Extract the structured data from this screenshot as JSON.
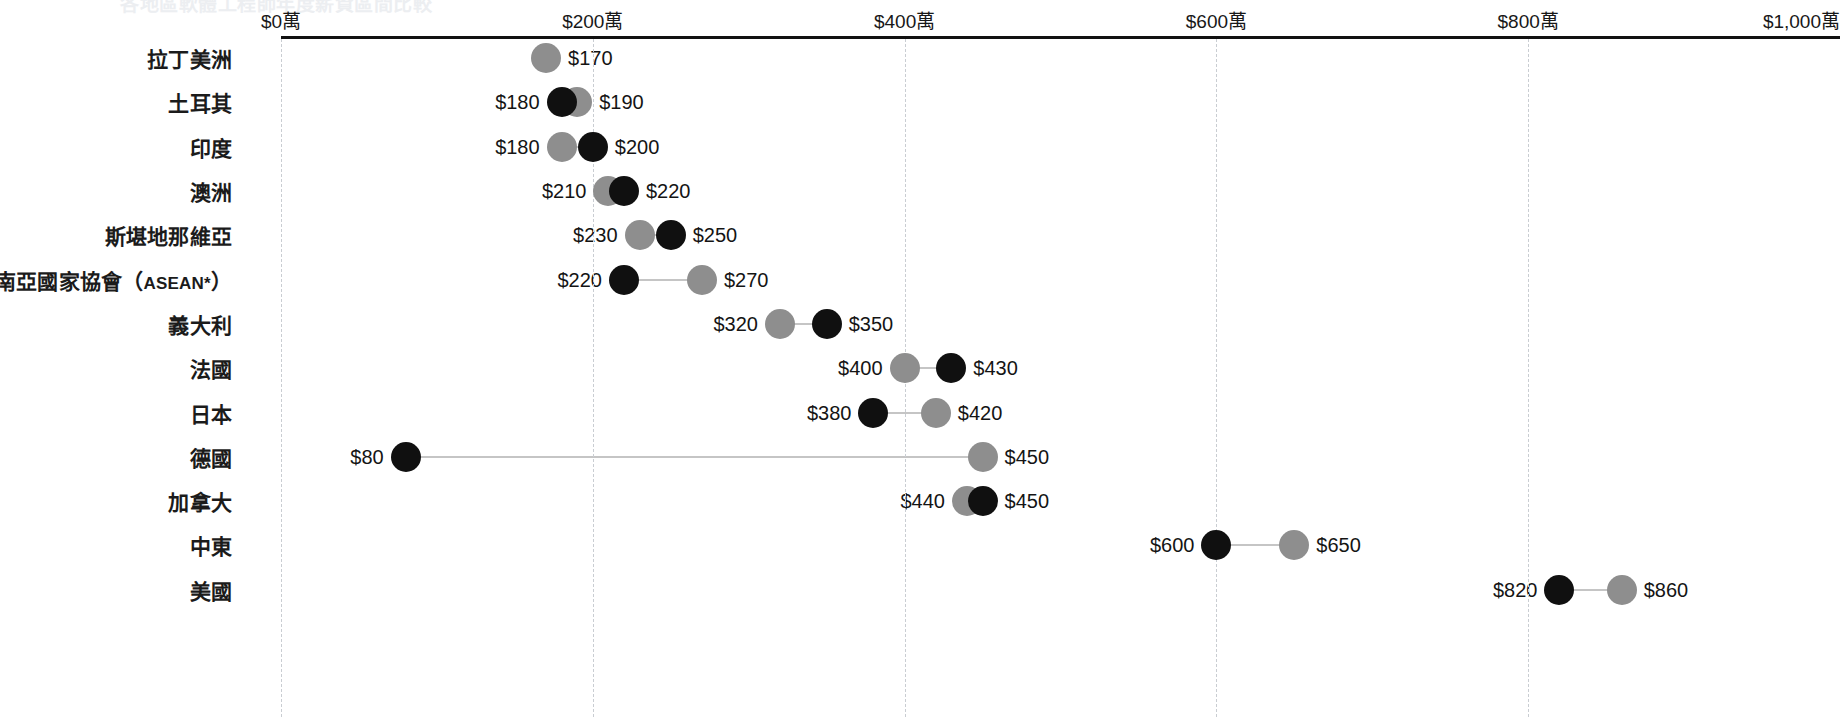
{
  "clipped_title": "各地區軟體工程師年度薪資區間比較",
  "axis": {
    "ticks": [
      {
        "label": "$0萬",
        "value": 0
      },
      {
        "label": "$200萬",
        "value": 200
      },
      {
        "label": "$400萬",
        "value": 400
      },
      {
        "label": "$600萬",
        "value": 600
      },
      {
        "label": "$800萬",
        "value": 800
      },
      {
        "label": "$1,000萬",
        "value": 1000
      }
    ],
    "min": 0,
    "max": 1000
  },
  "chart_data": {
    "type": "scatter",
    "subtype": "dumbbell",
    "title": "",
    "xlabel": "",
    "ylabel": "",
    "xlim": [
      0,
      1000
    ],
    "grid": true,
    "legend": "none",
    "unit_suffix": "萬",
    "series": [
      {
        "name": "dark",
        "color": "#101010"
      },
      {
        "name": "light",
        "color": "#8e8e8e"
      }
    ],
    "categories": [
      "拉丁美洲",
      "土耳其",
      "印度",
      "澳洲",
      "斯堪地那維亞",
      "東南亞國家協會（ASEAN*）",
      "義大利",
      "法國",
      "日本",
      "德國",
      "加拿大",
      "中東",
      "美國"
    ],
    "rows": [
      {
        "category": "拉丁美洲",
        "points": [
          {
            "series": "light",
            "value": 170,
            "label": "$170",
            "label_side": "right"
          }
        ]
      },
      {
        "category": "土耳其",
        "points": [
          {
            "series": "dark",
            "value": 180,
            "label": "$180",
            "label_side": "left"
          },
          {
            "series": "light",
            "value": 190,
            "label": "$190",
            "label_side": "right"
          }
        ]
      },
      {
        "category": "印度",
        "points": [
          {
            "series": "light",
            "value": 180,
            "label": "$180",
            "label_side": "left"
          },
          {
            "series": "dark",
            "value": 200,
            "label": "$200",
            "label_side": "right"
          }
        ]
      },
      {
        "category": "澳洲",
        "points": [
          {
            "series": "light",
            "value": 210,
            "label": "$210",
            "label_side": "left"
          },
          {
            "series": "dark",
            "value": 220,
            "label": "$220",
            "label_side": "right"
          }
        ]
      },
      {
        "category": "斯堪地那維亞",
        "points": [
          {
            "series": "light",
            "value": 230,
            "label": "$230",
            "label_side": "left"
          },
          {
            "series": "dark",
            "value": 250,
            "label": "$250",
            "label_side": "right"
          }
        ]
      },
      {
        "category": "東南亞國家協會（ASEAN*）",
        "points": [
          {
            "series": "dark",
            "value": 220,
            "label": "$220",
            "label_side": "left"
          },
          {
            "series": "light",
            "value": 270,
            "label": "$270",
            "label_side": "right"
          }
        ]
      },
      {
        "category": "義大利",
        "points": [
          {
            "series": "light",
            "value": 320,
            "label": "$320",
            "label_side": "left"
          },
          {
            "series": "dark",
            "value": 350,
            "label": "$350",
            "label_side": "right"
          }
        ]
      },
      {
        "category": "法國",
        "points": [
          {
            "series": "light",
            "value": 400,
            "label": "$400",
            "label_side": "left"
          },
          {
            "series": "dark",
            "value": 430,
            "label": "$430",
            "label_side": "right"
          }
        ]
      },
      {
        "category": "日本",
        "points": [
          {
            "series": "dark",
            "value": 380,
            "label": "$380",
            "label_side": "left"
          },
          {
            "series": "light",
            "value": 420,
            "label": "$420",
            "label_side": "right"
          }
        ]
      },
      {
        "category": "德國",
        "points": [
          {
            "series": "dark",
            "value": 80,
            "label": "$80",
            "label_side": "left"
          },
          {
            "series": "light",
            "value": 450,
            "label": "$450",
            "label_side": "right"
          }
        ]
      },
      {
        "category": "加拿大",
        "points": [
          {
            "series": "light",
            "value": 440,
            "label": "$440",
            "label_side": "left"
          },
          {
            "series": "dark",
            "value": 450,
            "label": "$450",
            "label_side": "right"
          }
        ]
      },
      {
        "category": "中東",
        "points": [
          {
            "series": "dark",
            "value": 600,
            "label": "$600",
            "label_side": "left"
          },
          {
            "series": "light",
            "value": 650,
            "label": "$650",
            "label_side": "right"
          }
        ]
      },
      {
        "category": "美國",
        "points": [
          {
            "series": "dark",
            "value": 820,
            "label": "$820",
            "label_side": "left"
          },
          {
            "series": "light",
            "value": 860,
            "label": "$860",
            "label_side": "right"
          }
        ]
      }
    ]
  }
}
